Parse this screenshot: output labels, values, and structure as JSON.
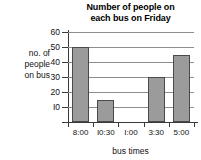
{
  "chart_data": {
    "type": "bar",
    "title": "Number of people on each bus on Friday",
    "title_line1": "Number of people on",
    "title_line2": "each bus on Friday",
    "xlabel": "bus times",
    "ylabel": "no. of people on bus",
    "ylabel_line1": "no. of",
    "ylabel_line2": "people",
    "ylabel_line3": "on bus",
    "categories": [
      "8:00",
      "10:30",
      "1:00",
      "3:30",
      "5:00"
    ],
    "values": [
      50,
      15,
      0,
      30,
      45
    ],
    "ylim": [
      0,
      60
    ],
    "yticks": [
      10,
      20,
      30,
      40,
      50,
      60
    ],
    "ytick_labels": [
      "I0",
      "20",
      "30",
      "40",
      "50",
      "60"
    ],
    "xtick_labels": [
      "8:00",
      "I0:30",
      "I:00",
      "3:30",
      "5:00"
    ],
    "grid": true,
    "legend": "none",
    "bar_color": "#9b9b9b",
    "bar_border_color": "#4a4a4a",
    "grid_color": "#8d8d8d",
    "axis_color": "#3a3a3a",
    "background": "#ffffff"
  }
}
